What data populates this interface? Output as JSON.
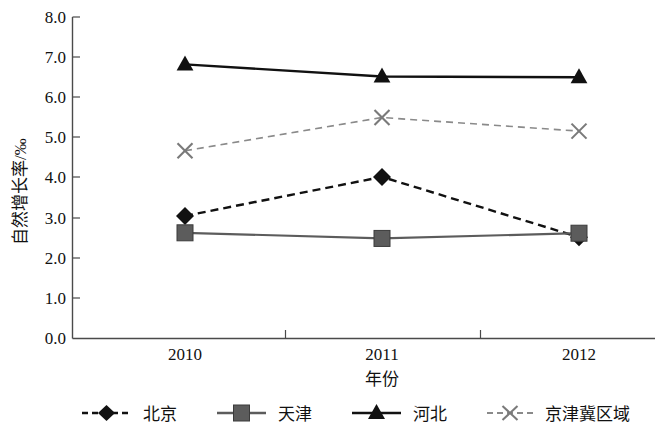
{
  "chart_data": {
    "type": "line",
    "title": "",
    "xlabel": "年份",
    "ylabel": "自然增长率/‰",
    "categories": [
      "2010",
      "2011",
      "2012"
    ],
    "x": [
      2010,
      2011,
      2012
    ],
    "ylim": [
      0.0,
      8.0
    ],
    "ytick_labels": [
      "0.0",
      "1.0",
      "2.0",
      "3.0",
      "4.0",
      "5.0",
      "6.0",
      "7.0",
      "8.0"
    ],
    "ytick_values": [
      0.0,
      1.0,
      2.0,
      3.0,
      4.0,
      5.0,
      6.0,
      7.0,
      8.0
    ],
    "grid": false,
    "legend_position": "bottom",
    "series": [
      {
        "name": "北京",
        "values": [
          3.05,
          4.02,
          2.52
        ],
        "marker": "diamond",
        "line_style": "dashed",
        "color": "#111111"
      },
      {
        "name": "天津",
        "values": [
          2.63,
          2.49,
          2.62
        ],
        "marker": "square",
        "line_style": "solid",
        "color": "#5c5c5c"
      },
      {
        "name": "河北",
        "values": [
          6.82,
          6.52,
          6.5
        ],
        "marker": "triangle",
        "line_style": "solid",
        "color": "#111111"
      },
      {
        "name": "京津冀区域",
        "values": [
          4.67,
          5.5,
          5.16
        ],
        "marker": "x",
        "line_style": "dashed",
        "color": "#8a8a8a"
      }
    ]
  },
  "legend": {
    "items": [
      {
        "label": "北京"
      },
      {
        "label": "天津"
      },
      {
        "label": "河北"
      },
      {
        "label": "京津冀区域"
      }
    ]
  }
}
